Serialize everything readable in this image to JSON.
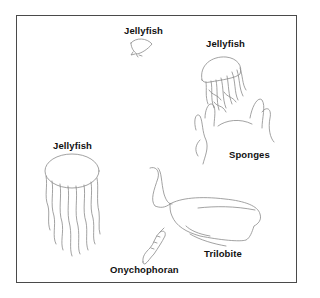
{
  "diagram": {
    "type": "illustration",
    "labels": {
      "jellyfish_small": "Jellyfish",
      "jellyfish_right": "Jellyfish",
      "jellyfish_left": "Jellyfish",
      "sponges": "Sponges",
      "trilobite": "Trilobite",
      "onychophoran": "Onychophoran"
    },
    "colors": {
      "frame": "#4a4a4a",
      "line_art": "#8a8a8a",
      "text": "#111111",
      "background": "#ffffff"
    }
  }
}
